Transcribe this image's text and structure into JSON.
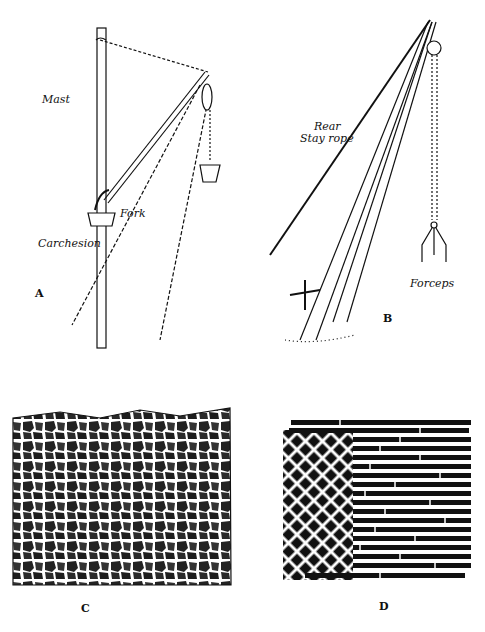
{
  "figure": {
    "panels": [
      {
        "id": "A",
        "letter": "A",
        "labels": {
          "mast": "Mast",
          "fork": "Fork",
          "carchesion": "Carchesion"
        }
      },
      {
        "id": "B",
        "letter": "B",
        "labels": {
          "rear_stay": "Rear",
          "rear_stay_2": "Stay rope",
          "forceps": "Forceps"
        }
      },
      {
        "id": "C",
        "letter": "C"
      },
      {
        "id": "D",
        "letter": "D"
      }
    ]
  }
}
